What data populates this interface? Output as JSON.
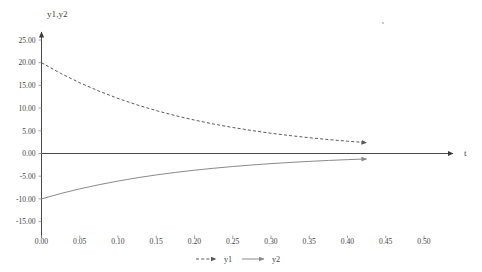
{
  "chart_data": {
    "type": "line",
    "title": "",
    "xlabel": "t",
    "ylabel": "y1,y2",
    "xlim": [
      0.0,
      0.5
    ],
    "ylim": [
      -15.0,
      25.0
    ],
    "grid": false,
    "legend_position": "bottom",
    "x_ticks": [
      "0.00",
      "0.05",
      "0.10",
      "0.15",
      "0.20",
      "0.25",
      "0.30",
      "0.35",
      "0.40",
      "0.45",
      "0.50"
    ],
    "x_tick_values": [
      0.0,
      0.05,
      0.1,
      0.15,
      0.2,
      0.25,
      0.3,
      0.35,
      0.4,
      0.45,
      0.5
    ],
    "y_ticks": [
      "25.00",
      "20.00",
      "15.00",
      "10.00",
      "5.00",
      "0.00",
      "-5.00",
      "-10.00",
      "-15.00"
    ],
    "y_tick_values": [
      25.0,
      20.0,
      15.0,
      10.0,
      5.0,
      0.0,
      -5.0,
      -10.0,
      -15.0
    ],
    "x": [
      0.0,
      0.025,
      0.05,
      0.075,
      0.1,
      0.125,
      0.15,
      0.175,
      0.2,
      0.225,
      0.25,
      0.275,
      0.3,
      0.325,
      0.35,
      0.375,
      0.4,
      0.425
    ],
    "series": [
      {
        "name": "y1",
        "style": "dashed",
        "color": "#595959",
        "end_arrow": true,
        "values": [
          20.0,
          17.65,
          15.58,
          13.75,
          12.13,
          10.71,
          9.45,
          8.34,
          7.36,
          6.49,
          5.73,
          5.06,
          4.46,
          3.94,
          3.48,
          3.07,
          2.71,
          2.39
        ]
      },
      {
        "name": "y2",
        "style": "solid",
        "color": "#8a8a8a",
        "end_arrow": true,
        "values": [
          -10.0,
          -8.82,
          -7.79,
          -6.88,
          -6.07,
          -5.35,
          -4.72,
          -4.17,
          -3.68,
          -3.25,
          -2.87,
          -2.53,
          -2.23,
          -1.97,
          -1.74,
          -1.53,
          -1.35,
          -1.2
        ]
      }
    ],
    "legend": [
      {
        "label": "y1",
        "style": "dashed",
        "color": "#595959"
      },
      {
        "label": "y2",
        "style": "solid",
        "color": "#8a8a8a"
      }
    ]
  }
}
